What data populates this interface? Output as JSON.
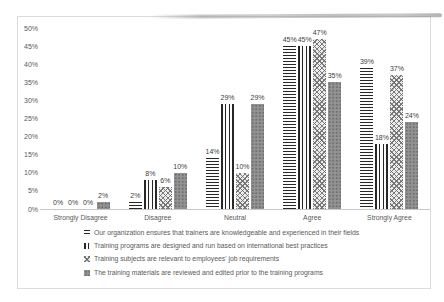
{
  "figure": {
    "kind": "scanned survey bar chart figure"
  },
  "chart_data": {
    "type": "bar",
    "categories": [
      "Strongly Disagree",
      "Disagree",
      "Neutral",
      "Agree",
      "Strongly Agree"
    ],
    "series": [
      {
        "name": "Our organization ensures that trainers are knowledgeable and experienced in their fields",
        "pattern": "hstripe",
        "values": [
          0,
          2,
          14,
          45,
          39
        ]
      },
      {
        "name": "Training programs are designed and run based on international best practices",
        "pattern": "vstripe",
        "values": [
          0,
          8,
          29,
          45,
          18
        ]
      },
      {
        "name": "Training subjects are relevant to employees' job requirements",
        "pattern": "wave",
        "values": [
          0,
          6,
          10,
          47,
          37
        ]
      },
      {
        "name": "The training materials are reviewed and edited prior to the training programs",
        "pattern": "dots",
        "values": [
          2,
          10,
          29,
          35,
          24
        ]
      }
    ],
    "title": "",
    "xlabel": "",
    "ylabel": "",
    "ylim": [
      0,
      50
    ],
    "ytick_step": 5,
    "value_suffix": "%",
    "data_labels": true,
    "grid": false,
    "legend_position": "bottom-left",
    "colors": {
      "stripe_dark": "#262626",
      "wave_gray": "#ababab",
      "solid_gray": "#929292",
      "axis": "#c9c9c9",
      "text": "#595959",
      "box_border": "#dcdcdc"
    }
  }
}
